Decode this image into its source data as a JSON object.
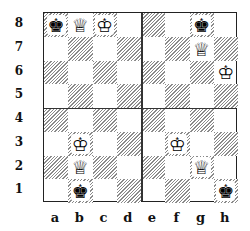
{
  "diagram": {
    "type": "chessboard",
    "ranks": [
      "8",
      "7",
      "6",
      "5",
      "4",
      "3",
      "2",
      "1"
    ],
    "files": [
      "a",
      "b",
      "c",
      "d",
      "e",
      "f",
      "g",
      "h"
    ],
    "quadrant_dividers": {
      "vertical_between_files": [
        "d",
        "e"
      ],
      "horizontal_between_ranks": [
        "5",
        "4"
      ]
    },
    "colors": {
      "dark_square_hatch": "#8a8a8a",
      "light_square": "#ffffff",
      "border": "#222222"
    },
    "pieces": [
      {
        "square": "a8",
        "piece": "king",
        "color": "black",
        "glyph": "♚"
      },
      {
        "square": "b8",
        "piece": "queen",
        "color": "white",
        "glyph": "♕"
      },
      {
        "square": "c8",
        "piece": "king",
        "color": "white",
        "glyph": "♔"
      },
      {
        "square": "g8",
        "piece": "king",
        "color": "black",
        "glyph": "♚"
      },
      {
        "square": "g7",
        "piece": "queen",
        "color": "white",
        "glyph": "♕"
      },
      {
        "square": "h6",
        "piece": "king",
        "color": "white",
        "glyph": "♔"
      },
      {
        "square": "b3",
        "piece": "king",
        "color": "white",
        "glyph": "♔"
      },
      {
        "square": "b2",
        "piece": "queen",
        "color": "white",
        "glyph": "♕"
      },
      {
        "square": "b1",
        "piece": "king",
        "color": "black",
        "glyph": "♚"
      },
      {
        "square": "f3",
        "piece": "king",
        "color": "white",
        "glyph": "♔"
      },
      {
        "square": "g2",
        "piece": "queen",
        "color": "white",
        "glyph": "♕"
      },
      {
        "square": "h1",
        "piece": "king",
        "color": "black",
        "glyph": "♚"
      }
    ]
  }
}
